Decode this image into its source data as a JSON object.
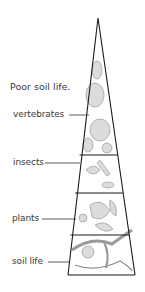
{
  "title": "Poor soil life.",
  "pyramid": {
    "levels": [
      {
        "label": "vertebrates",
        "content": "animal sketches (bear, deer, birds)"
      },
      {
        "label": "insects",
        "content": "insect sketches (beetle, caterpillar)"
      },
      {
        "label": "plants",
        "content": "plant and flower sketches"
      },
      {
        "label": "soil life",
        "content": "earthworm, centipede, soil organisms"
      }
    ]
  },
  "colors": {
    "outline": "#1a1a1a",
    "text": "#3a3a3a",
    "sketch": "#8a8a8a",
    "fill": "#d9d9d9"
  }
}
